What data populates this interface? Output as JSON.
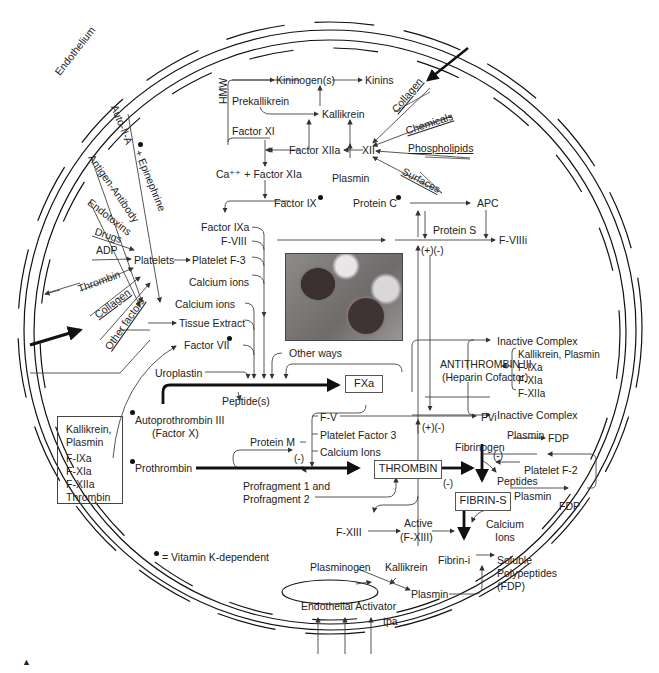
{
  "diagram": {
    "endothelium_label": "Endothelium",
    "legend": {
      "dot_meaning": "= Vitamin K-dependent"
    },
    "corner_mark": "▲"
  },
  "left_inputs": {
    "auto_ii_a": "Auto-II-A",
    "epinephrine": "+ Epinephrine",
    "antigen_antibody": "Antigen-Antibody",
    "endotoxins": "Endotoxins",
    "drugs": "Drugs",
    "adp": "ADP",
    "thrombin": "Thrombin",
    "collagen": "Collagen",
    "other_factors": "Other factors"
  },
  "platelets": {
    "platelets": "Platelets",
    "platelet_f3": "Platelet F-3"
  },
  "contact_pathway": {
    "hmw": "HMW",
    "kininogens": "Kininogen(s)",
    "kinins": "Kinins",
    "prekallikrein": "Prekallikrein",
    "kallikrein": "Kallikrein",
    "factor_xi": "Factor XI",
    "factor_xiia": "Factor XIIa",
    "xii": "XII",
    "plasmin": "Plasmin",
    "ca_factor_xia": "Ca⁺⁺ + Factor XIa",
    "factor_ix": "Factor IX"
  },
  "activators_right": {
    "collagen": "Collagen",
    "chemicals": "Chemicals",
    "phospholipids": "Phospholipids",
    "surfaces": "Surfaces"
  },
  "protein_c": {
    "protein_c": "Protein C",
    "apc": "APC",
    "protein_s": "Protein S",
    "f_viiii": "F-VIIIi",
    "plus_minus_1": "(+)(-)"
  },
  "tenase_inputs": {
    "factor_ixa": "Factor IXa",
    "f_viii": "F-VIII",
    "platelet_f3": "Platelet F-3",
    "calcium_ions_1": "Calcium ions",
    "calcium_ions_2": "Calcium ions",
    "tissue_extract": "Tissue Extract",
    "factor_vii": "Factor VII",
    "other_ways": "Other ways",
    "uroplastin": "Uroplastin",
    "peptides": "Peptide(s)"
  },
  "factor_x": {
    "autoprothrombin": "Autoprothrombin III",
    "factor_x": "(Factor X)",
    "fxa": "FXa"
  },
  "antithrombin": {
    "inactive_complex_1": "Inactive Complex",
    "inactive_complex_2": "Inactive Complex",
    "name": "ANTITHROMBIN III",
    "subtitle": "(Heparin Cofactor)",
    "targets": [
      "Kallikrein, Plasmin",
      "F-IXa",
      "F-XIa",
      "F-XIIa"
    ]
  },
  "inhibited_box": {
    "items": [
      "Kallikrein,",
      "Plasmin",
      "F-IXa",
      "F-XIa",
      "F-XIIa",
      "Thrombin"
    ]
  },
  "prothrombinase": {
    "f_v": "F-V",
    "fvi": "FVi",
    "plus_minus_2": "(+)(-)",
    "protein_m": "Protein M",
    "platelet_factor_3": "Platelet Factor 3",
    "calcium_ions": "Calcium Ions",
    "minus_1": "(-)",
    "prothrombin": "Prothrombin",
    "profragment_1": "Profragment 1 and",
    "profragment_2": "Profragment 2",
    "thrombin": "THROMBIN",
    "minus_2": "(-)"
  },
  "fibrin": {
    "fibrinogen": "Fibrinogen",
    "plasmin_1": "Plasmin",
    "fdp_1": "FDP",
    "minus_3": "(-)",
    "platelet_f2": "Platelet F-2",
    "peptides": "Peptides",
    "fibrin_s": "FIBRIN-S",
    "plasmin_2": "Plasmin",
    "fdp_2": "FDP",
    "calcium_ions": "Calcium",
    "ions": "Ions",
    "f_xiii": "F-XIII",
    "active": "Active",
    "active_fxiii": "(F-XIII)",
    "fibrin_i": "Fibrin-i",
    "soluble": "Soluble",
    "polypeptides": "Polypeptides",
    "fdp_3": "(FDP)"
  },
  "fibrinolysis": {
    "plasminogen": "Plasminogen",
    "kallikrein": "Kallikrein",
    "plasmin": "Plasmin",
    "endothelial_activator": "Endothelial Activator",
    "tpa": "tpa"
  }
}
